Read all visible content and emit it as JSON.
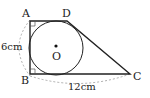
{
  "figure": {
    "type": "geometry",
    "points": {
      "A": {
        "label": "A",
        "x": 30,
        "y": 21
      },
      "B": {
        "label": "B",
        "x": 30,
        "y": 74
      },
      "C": {
        "label": "C",
        "x": 130,
        "y": 74
      },
      "D": {
        "label": "D",
        "x": 67,
        "y": 21
      },
      "O": {
        "label": "O",
        "x": 56,
        "y": 48
      }
    },
    "circle": {
      "center": "O",
      "radius": 27
    },
    "measurements": {
      "AB": "6cm",
      "BC": "12cm"
    },
    "right_angles": [
      "A",
      "B"
    ],
    "colors": {
      "stroke": "#222222",
      "dashed": "#999999",
      "background": "#ffffff"
    }
  }
}
